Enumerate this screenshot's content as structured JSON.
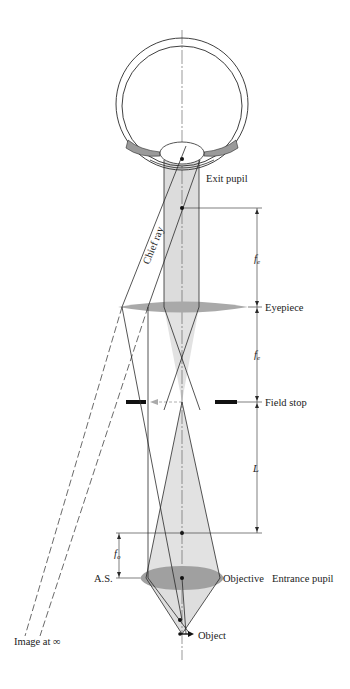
{
  "diagram": {
    "type": "optical-ray-diagram",
    "labels": {
      "exit_pupil": "Exit pupil",
      "chief_ray": "Chief ray",
      "eyepiece": "Eyepiece",
      "field_stop": "Field stop",
      "objective": "Objective",
      "entrance_pupil": "Entrance pupil",
      "aperture_stop": "A.S.",
      "object": "Object",
      "image_at_infinity": "Image at ∞"
    },
    "dimensions": {
      "fe_upper": "f",
      "fe_upper_sub": "e",
      "fe_lower": "f",
      "fe_lower_sub": "e",
      "tube_length": "L",
      "fo": "f",
      "fo_sub": "o"
    },
    "colors": {
      "line": "#2a2a2a",
      "beam": "#d9d9d9",
      "lens": "#a8a8a8",
      "stop": "#111111"
    }
  }
}
